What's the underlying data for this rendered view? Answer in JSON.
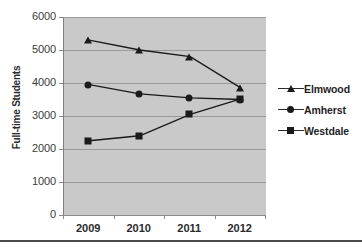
{
  "chart_data": {
    "type": "line",
    "title": "",
    "xlabel": "",
    "ylabel": "Full-time Students",
    "categories": [
      "2009",
      "2010",
      "2011",
      "2012"
    ],
    "ylim": [
      0,
      6000
    ],
    "yticks": [
      0,
      1000,
      2000,
      3000,
      4000,
      5000,
      6000
    ],
    "ytick_labels": [
      "0",
      "1000",
      "2000",
      "3000",
      "4000",
      "5000",
      "6000"
    ],
    "grid": true,
    "legend_position": "right",
    "plot_background": "#c9c9c9",
    "series_color": "#1a1a1a",
    "series": [
      {
        "name": "Elmwood",
        "marker": "triangle",
        "values": [
          5300,
          5000,
          4800,
          3850
        ]
      },
      {
        "name": "Amherst",
        "marker": "circle",
        "values": [
          3950,
          3670,
          3550,
          3500
        ]
      },
      {
        "name": "Westdale",
        "marker": "square",
        "values": [
          2250,
          2400,
          3050,
          3520
        ]
      }
    ]
  },
  "legend": {
    "items": [
      {
        "label": "Elmwood",
        "marker": "triangle"
      },
      {
        "label": "Amherst",
        "marker": "circle"
      },
      {
        "label": "Westdale",
        "marker": "square"
      }
    ]
  }
}
